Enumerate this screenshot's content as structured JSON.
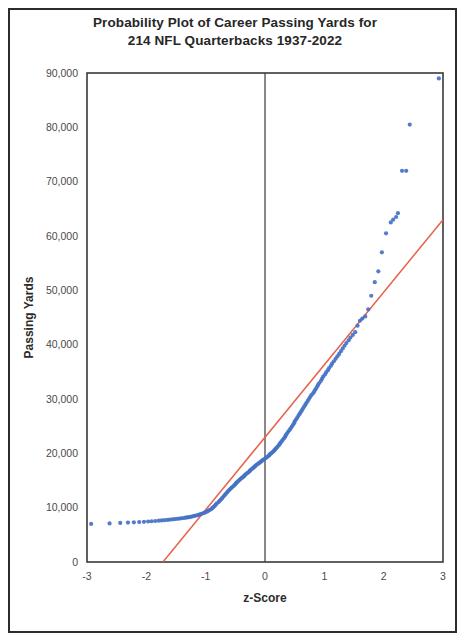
{
  "chart_data": {
    "type": "scatter",
    "title": "Probability Plot of Career Passing Yards for 214 NFL Quarterbacks 1937-2022",
    "title_line1": "Probability Plot of Career Passing Yards for",
    "title_line2": "214 NFL Quarterbacks 1937-2022",
    "xlabel": "z-Score",
    "ylabel": "Passing Yards",
    "xlim": [
      -3,
      3
    ],
    "ylim": [
      0,
      90000
    ],
    "xticks": [
      "-3",
      "-2",
      "-1",
      "0",
      "1",
      "2",
      "3"
    ],
    "xtick_values": [
      -3,
      -2,
      -1,
      0,
      1,
      2,
      3
    ],
    "yticks": [
      "0",
      "10,000",
      "20,000",
      "30,000",
      "40,000",
      "50,000",
      "60,000",
      "70,000",
      "80,000",
      "90,000"
    ],
    "ytick_values": [
      0,
      10000,
      20000,
      30000,
      40000,
      50000,
      60000,
      70000,
      80000,
      90000
    ],
    "grid": false,
    "legend": false,
    "point_color": "#4472c4",
    "reference_line_color": "#e8604c",
    "axis_color": "#3a3a3a",
    "zero_line_color": "#3a3a3a",
    "n_points": 214,
    "series": [
      {
        "name": "Career Passing Yards",
        "marker": "circle",
        "color": "#4472c4",
        "points": [
          [
            -2.93,
            7000
          ],
          [
            -2.62,
            7100
          ],
          [
            -2.44,
            7200
          ],
          [
            -2.31,
            7250
          ],
          [
            -2.21,
            7300
          ],
          [
            -2.12,
            7350
          ],
          [
            -2.04,
            7400
          ],
          [
            -1.97,
            7450
          ],
          [
            -1.91,
            7500
          ],
          [
            -1.85,
            7550
          ],
          [
            -1.79,
            7600
          ],
          [
            -1.74,
            7650
          ],
          [
            -1.69,
            7700
          ],
          [
            -1.64,
            7750
          ],
          [
            -1.6,
            7800
          ],
          [
            -1.56,
            7850
          ],
          [
            -1.52,
            7900
          ],
          [
            -1.48,
            7950
          ],
          [
            -1.44,
            8000
          ],
          [
            -1.41,
            8050
          ],
          [
            -1.37,
            8100
          ],
          [
            -1.34,
            8150
          ],
          [
            -1.31,
            8200
          ],
          [
            -1.28,
            8250
          ],
          [
            -1.25,
            8320
          ],
          [
            -1.22,
            8400
          ],
          [
            -1.19,
            8480
          ],
          [
            -1.16,
            8560
          ],
          [
            -1.13,
            8640
          ],
          [
            -1.11,
            8720
          ],
          [
            -1.08,
            8820
          ],
          [
            -1.06,
            8920
          ],
          [
            -1.03,
            9020
          ],
          [
            -1.01,
            9120
          ],
          [
            -0.98,
            9250
          ],
          [
            -0.96,
            9400
          ],
          [
            -0.94,
            9550
          ],
          [
            -0.91,
            9700
          ],
          [
            -0.89,
            9900
          ],
          [
            -0.87,
            10100
          ],
          [
            -0.85,
            10300
          ],
          [
            -0.83,
            10550
          ],
          [
            -0.81,
            10800
          ],
          [
            -0.78,
            11050
          ],
          [
            -0.76,
            11300
          ],
          [
            -0.74,
            11550
          ],
          [
            -0.72,
            11800
          ],
          [
            -0.7,
            12050
          ],
          [
            -0.68,
            12300
          ],
          [
            -0.66,
            12550
          ],
          [
            -0.64,
            12800
          ],
          [
            -0.62,
            13050
          ],
          [
            -0.6,
            13280
          ],
          [
            -0.58,
            13500
          ],
          [
            -0.56,
            13700
          ],
          [
            -0.54,
            13900
          ],
          [
            -0.52,
            14100
          ],
          [
            -0.5,
            14300
          ],
          [
            -0.49,
            14500
          ],
          [
            -0.47,
            14700
          ],
          [
            -0.45,
            14900
          ],
          [
            -0.43,
            15100
          ],
          [
            -0.41,
            15300
          ],
          [
            -0.39,
            15480
          ],
          [
            -0.37,
            15650
          ],
          [
            -0.35,
            15820
          ],
          [
            -0.34,
            16000
          ],
          [
            -0.32,
            16180
          ],
          [
            -0.3,
            16350
          ],
          [
            -0.28,
            16520
          ],
          [
            -0.26,
            16700
          ],
          [
            -0.25,
            16880
          ],
          [
            -0.23,
            17050
          ],
          [
            -0.21,
            17220
          ],
          [
            -0.19,
            17400
          ],
          [
            -0.17,
            17580
          ],
          [
            -0.16,
            17750
          ],
          [
            -0.14,
            17900
          ],
          [
            -0.12,
            18050
          ],
          [
            -0.1,
            18200
          ],
          [
            -0.08,
            18350
          ],
          [
            -0.07,
            18500
          ],
          [
            -0.05,
            18650
          ],
          [
            -0.03,
            18800
          ],
          [
            -0.01,
            18950
          ],
          [
            0.01,
            19100
          ],
          [
            0.03,
            19280
          ],
          [
            0.05,
            19450
          ],
          [
            0.07,
            19620
          ],
          [
            0.08,
            19800
          ],
          [
            0.1,
            19980
          ],
          [
            0.12,
            20150
          ],
          [
            0.14,
            20350
          ],
          [
            0.16,
            20550
          ],
          [
            0.17,
            20750
          ],
          [
            0.19,
            20950
          ],
          [
            0.21,
            21200
          ],
          [
            0.23,
            21450
          ],
          [
            0.25,
            21700
          ],
          [
            0.26,
            21950
          ],
          [
            0.28,
            22200
          ],
          [
            0.3,
            22480
          ],
          [
            0.32,
            22760
          ],
          [
            0.34,
            23050
          ],
          [
            0.35,
            23350
          ],
          [
            0.37,
            23650
          ],
          [
            0.39,
            23950
          ],
          [
            0.41,
            24250
          ],
          [
            0.43,
            24550
          ],
          [
            0.45,
            24880
          ],
          [
            0.47,
            25200
          ],
          [
            0.49,
            25520
          ],
          [
            0.5,
            25850
          ],
          [
            0.52,
            26180
          ],
          [
            0.54,
            26500
          ],
          [
            0.56,
            26850
          ],
          [
            0.58,
            27200
          ],
          [
            0.6,
            27550
          ],
          [
            0.62,
            27900
          ],
          [
            0.64,
            28250
          ],
          [
            0.66,
            28600
          ],
          [
            0.68,
            28950
          ],
          [
            0.7,
            29300
          ],
          [
            0.72,
            29650
          ],
          [
            0.74,
            30000
          ],
          [
            0.76,
            30350
          ],
          [
            0.78,
            30700
          ],
          [
            0.81,
            31050
          ],
          [
            0.83,
            31400
          ],
          [
            0.85,
            31750
          ],
          [
            0.87,
            32100
          ],
          [
            0.89,
            32500
          ],
          [
            0.91,
            32900
          ],
          [
            0.94,
            33300
          ],
          [
            0.96,
            33700
          ],
          [
            0.98,
            34100
          ],
          [
            1.01,
            34500
          ],
          [
            1.03,
            34900
          ],
          [
            1.06,
            35300
          ],
          [
            1.08,
            35700
          ],
          [
            1.11,
            36100
          ],
          [
            1.13,
            36500
          ],
          [
            1.16,
            36950
          ],
          [
            1.19,
            37400
          ],
          [
            1.22,
            37850
          ],
          [
            1.25,
            38300
          ],
          [
            1.28,
            38800
          ],
          [
            1.31,
            39300
          ],
          [
            1.34,
            39800
          ],
          [
            1.37,
            40300
          ],
          [
            1.41,
            40800
          ],
          [
            1.44,
            41300
          ],
          [
            1.48,
            41800
          ],
          [
            1.52,
            42300
          ],
          [
            1.56,
            43500
          ],
          [
            1.6,
            44400
          ],
          [
            1.64,
            44800
          ],
          [
            1.69,
            45200
          ],
          [
            1.74,
            46500
          ],
          [
            1.79,
            49000
          ],
          [
            1.85,
            51500
          ],
          [
            1.91,
            53500
          ],
          [
            1.97,
            57000
          ],
          [
            2.04,
            60500
          ],
          [
            2.12,
            62500
          ],
          [
            2.16,
            63000
          ],
          [
            2.21,
            63500
          ],
          [
            2.24,
            64200
          ],
          [
            2.31,
            72000
          ],
          [
            2.38,
            72000
          ],
          [
            2.44,
            80500
          ],
          [
            2.93,
            89000
          ]
        ]
      }
    ],
    "reference_line": {
      "name": "Normal reference line",
      "color": "#e8604c",
      "x_start": -1.72,
      "y_start": 0,
      "x_end": 3.0,
      "y_end": 63000
    },
    "zero_reference_line": {
      "name": "z=0 vertical line",
      "x": 0
    }
  }
}
